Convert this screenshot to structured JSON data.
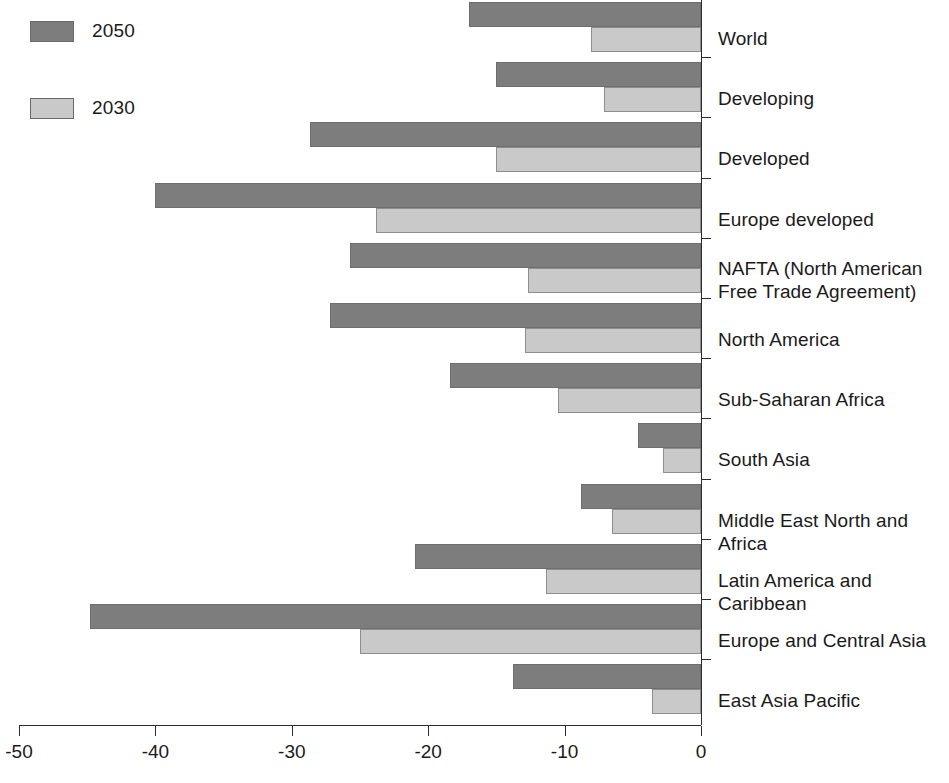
{
  "legend": {
    "items": [
      {
        "label": "2050",
        "color": "#7d7d7d",
        "series": "s2050"
      },
      {
        "label": "2030",
        "color": "#c9c9c9",
        "series": "s2030"
      }
    ]
  },
  "axis": {
    "ticks": [
      {
        "value": -50,
        "label": "-50"
      },
      {
        "value": -40,
        "label": "-40"
      },
      {
        "value": -30,
        "label": "-30"
      },
      {
        "value": -20,
        "label": "-20"
      },
      {
        "value": -10,
        "label": "-10"
      },
      {
        "value": 0,
        "label": "0"
      }
    ]
  },
  "chart_data": {
    "type": "bar",
    "orientation": "horizontal",
    "title": "",
    "xlabel": "",
    "ylabel": "",
    "xlim": [
      -50,
      0
    ],
    "grid": false,
    "legend_position": "top-left",
    "categories": [
      "World",
      "Developing",
      "Developed",
      "Europe developed",
      "NAFTA (North American\nFree Trade Agreement)",
      "North America",
      "Sub-Saharan Africa",
      "South Asia",
      "Middle East North and Africa",
      "Latin America and Caribbean",
      "Europe and Central Asia",
      "East Asia Pacific"
    ],
    "series": [
      {
        "name": "2050",
        "color": "#7d7d7d",
        "values": [
          -17.0,
          -15.0,
          -28.7,
          -40.0,
          -25.7,
          -27.2,
          -18.4,
          -4.6,
          -8.8,
          -21.0,
          -44.8,
          -13.8
        ]
      },
      {
        "name": "2030",
        "color": "#c9c9c9",
        "values": [
          -8.1,
          -7.1,
          -15.0,
          -23.8,
          -12.7,
          -12.9,
          -10.5,
          -2.8,
          -6.5,
          -11.4,
          -25.0,
          -3.6
        ]
      }
    ]
  }
}
